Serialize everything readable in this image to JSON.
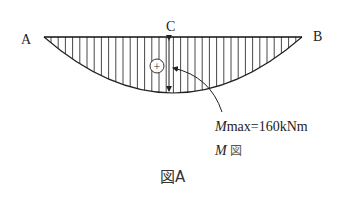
{
  "diagram": {
    "label_a": "A",
    "label_b": "B",
    "label_c": "C",
    "sign": "+",
    "mmax_label_m": "M",
    "mmax_label_rest": "max=160kNm",
    "mdiagram_m": "M",
    "mdiagram_rest": "図",
    "caption": "図A",
    "mmax_value_kNm": 160
  }
}
